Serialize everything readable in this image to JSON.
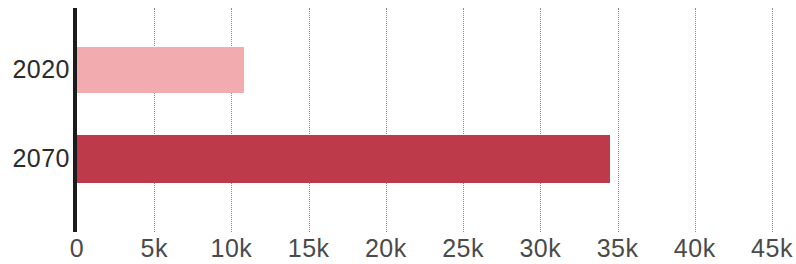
{
  "chart_data": {
    "type": "bar",
    "orientation": "horizontal",
    "title": "",
    "subtitle": "",
    "xlabel": "",
    "ylabel": "",
    "categories": [
      "2020",
      "2070"
    ],
    "values": [
      10800,
      34500
    ],
    "series": [
      {
        "name": "",
        "values": [
          10800,
          34500
        ],
        "colors": [
          "#f2abae",
          "#bc3a49"
        ]
      }
    ],
    "bars": [
      {
        "category": "2020",
        "value": 10800,
        "value_label": "",
        "color": "#f2abae"
      },
      {
        "category": "2070",
        "value": 34500,
        "value_label": "",
        "color": "#bc3a49"
      }
    ],
    "xlim": [
      0,
      45000
    ],
    "xticks": [
      0,
      5000,
      10000,
      15000,
      20000,
      25000,
      30000,
      35000,
      40000,
      45000
    ],
    "xtick_labels": [
      "0",
      "5k",
      "10k",
      "15k",
      "20k",
      "25k",
      "30k",
      "35k",
      "40k",
      "45k"
    ],
    "grid": true,
    "grid_axis": "x",
    "grid_style": "dotted",
    "grid_color": "#8c8c8c",
    "legend": false,
    "legend_position": "none",
    "axis_color": "#1c1c1c",
    "background_color": "#ffffff",
    "tick_label_color": "#4a4a4a",
    "category_label_color": "#2b2b2b",
    "annotations": []
  }
}
